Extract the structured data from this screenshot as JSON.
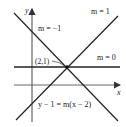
{
  "diagram": {
    "axes": {
      "x_label": "x",
      "y_label": "y"
    },
    "point": {
      "label": "(2,1)",
      "x": 2,
      "y": 1
    },
    "lines": [
      {
        "slope_label": "m = −1",
        "m": -1
      },
      {
        "slope_label": "m = 1",
        "m": 1
      },
      {
        "slope_label": "m = 0",
        "m": 0
      }
    ],
    "equation": "y − 1 = m(x − 2)",
    "colors": {
      "line": "#222222",
      "axis": "#555555",
      "background": "#ffffff"
    }
  }
}
